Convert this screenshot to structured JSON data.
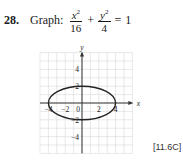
{
  "problem": {
    "number": "28.",
    "verb": "Graph:",
    "equation": {
      "term1": {
        "numerator_var": "x",
        "numerator_exp": "2",
        "denominator": "16"
      },
      "operator": "+",
      "term2": {
        "numerator_var": "y",
        "numerator_exp": "2",
        "denominator": "4"
      },
      "equals": "=",
      "rhs": "1"
    },
    "section_ref": "[11.6C]"
  },
  "graph": {
    "x_axis_label": "x",
    "y_axis_label": "y",
    "x_tick_labels": [
      "−4",
      "−2",
      "0",
      "2",
      "4"
    ],
    "y_tick_labels": [
      "4",
      "2",
      "−2",
      "−4"
    ],
    "grid_x_range": [
      -5,
      6
    ],
    "grid_y_range": [
      -6,
      6
    ],
    "ellipse": {
      "center": [
        0,
        0
      ],
      "semi_major_x": 4,
      "semi_minor_y": 2
    },
    "colors": {
      "grid": "#d8d8d8",
      "axis": "#333333",
      "curve": "#222222"
    }
  },
  "chart_data": {
    "type": "line",
    "xlabel": "x",
    "ylabel": "y",
    "xlim": [
      -5,
      6
    ],
    "ylim": [
      -6,
      6
    ],
    "grid": true,
    "x_ticks": [
      -4,
      -2,
      0,
      2,
      4
    ],
    "y_ticks": [
      -4,
      -2,
      2,
      4
    ],
    "series": [
      {
        "name": "ellipse x^2/16 + y^2/4 = 1",
        "shape": "ellipse",
        "center": [
          0,
          0
        ],
        "a": 4,
        "b": 2,
        "vertices": [
          [
            -4,
            0
          ],
          [
            4,
            0
          ],
          [
            0,
            2
          ],
          [
            0,
            -2
          ]
        ]
      }
    ]
  }
}
